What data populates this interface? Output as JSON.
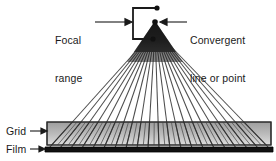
{
  "figure": {
    "background_color": "#ffffff",
    "width": 276,
    "height": 161
  },
  "labels": {
    "focal_range": {
      "line1": "Focal",
      "line2": "range",
      "text": "Focal range",
      "pointer": "arrow-right"
    },
    "convergent": {
      "line1": "Convergent",
      "line2": "line or point",
      "text": "Convergent line or point",
      "pointer": "arrow-left"
    },
    "grid": {
      "text": "Grid",
      "pointer": "arrow-right"
    },
    "film": {
      "text": "Film",
      "pointer": "arrow-right"
    }
  },
  "colors": {
    "ink": "#1a1a1a",
    "line": "#4d4d4d",
    "grid_fill_top": "#9d9d9d",
    "grid_fill_bottom": "#d8d8d8",
    "film_fill": "#111111",
    "cone_fill": "#141414",
    "white": "#ffffff"
  },
  "geometry": {
    "convergent_point": {
      "x": 155,
      "y": 22
    },
    "focal_range_near": {
      "x": 152,
      "y": 39
    },
    "focal_range_far": {
      "x": 156,
      "y": 8
    },
    "focal_bracket": {
      "left": 133,
      "top": 8,
      "right": 156,
      "bottom": 39
    },
    "ray_count": 21,
    "grid_band": {
      "x_left": 47,
      "x_right": 271,
      "y_top": 122,
      "y_bottom": 145
    },
    "film_bar": {
      "x_left": 45,
      "x_right": 273,
      "y_top": 147,
      "y_bottom": 152
    },
    "fan_span_at_film": {
      "x_left": 49,
      "x_right": 270
    }
  },
  "elements": {
    "convergent_dot": "filled-circle",
    "focal_far_dot": "filled-circle",
    "focal_near_dot": "filled-circle",
    "cone": "black-triangle-beam",
    "grid_lamellae": "angled-septa-lines",
    "film_layer": "black-bar"
  }
}
